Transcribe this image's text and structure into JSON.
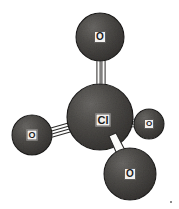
{
  "figure": {
    "kind": "molecular-structure-diagram",
    "background_color": "#ffffff",
    "width": 179,
    "height": 209
  },
  "palette": {
    "atom_fill_dark": "#3d3b39",
    "atom_fill_mid": "#4a4846",
    "atom_fill_light": "#5e5c59",
    "atom_outline": "#1c1b1a",
    "bond_fill": "#fbfbfa",
    "bond_outline": "#2a2928",
    "label_background": "#f2f0ee",
    "label_text": "#1b1b1b",
    "label_border": "#5c5a58"
  },
  "atoms": [
    {
      "id": "cl-center",
      "label": "Cl",
      "element": "Cl",
      "role": "central-atom",
      "cx": 100,
      "cy": 117,
      "r": 33,
      "label_font_size": 11,
      "label_width": 15,
      "label_height": 13
    },
    {
      "id": "o-top",
      "label": "O",
      "element": "O",
      "role": "terminal-atom",
      "cx": 100,
      "cy": 37,
      "r": 24,
      "label_font_size": 10,
      "label_width": 12,
      "label_height": 12
    },
    {
      "id": "o-left",
      "label": "O",
      "element": "O",
      "role": "terminal-atom",
      "cx": 32,
      "cy": 135,
      "r": 20,
      "label_font_size": 9,
      "label_width": 11,
      "label_height": 11
    },
    {
      "id": "o-right",
      "label": "O",
      "element": "O",
      "role": "terminal-atom",
      "cx": 149,
      "cy": 124,
      "r": 15,
      "label_font_size": 8,
      "label_width": 10,
      "label_height": 10
    },
    {
      "id": "o-bottom-right",
      "label": "O",
      "element": "O",
      "role": "terminal-atom",
      "cx": 130,
      "cy": 174,
      "r": 26,
      "label_font_size": 10,
      "label_width": 12,
      "label_height": 12
    }
  ],
  "bonds": [
    {
      "id": "bond-cl-o-top",
      "from": "cl-center",
      "to": "o-top",
      "style": "double",
      "x1": 101,
      "y1": 92,
      "x2": 101,
      "y2": 58,
      "gap": 5,
      "thickness": 3
    },
    {
      "id": "bond-cl-o-left",
      "from": "cl-center",
      "to": "o-left",
      "style": "double",
      "x1": 72,
      "y1": 126,
      "x2": 48,
      "y2": 134,
      "gap": 5,
      "thickness": 3
    },
    {
      "id": "bond-cl-o-right",
      "from": "cl-center",
      "to": "o-right",
      "style": "double",
      "x1": 128,
      "y1": 122,
      "x2": 137,
      "y2": 123,
      "gap": 4,
      "thickness": 3
    },
    {
      "id": "bond-cl-o-bottom-right",
      "from": "cl-center",
      "to": "o-bottom-right",
      "style": "wedge",
      "x1": 112,
      "y1": 139,
      "x2": 124,
      "y2": 156,
      "gap": 0,
      "thickness": 6
    }
  ],
  "artifacts": [
    {
      "id": "scan-speck",
      "x": 170,
      "y": 201
    }
  ]
}
